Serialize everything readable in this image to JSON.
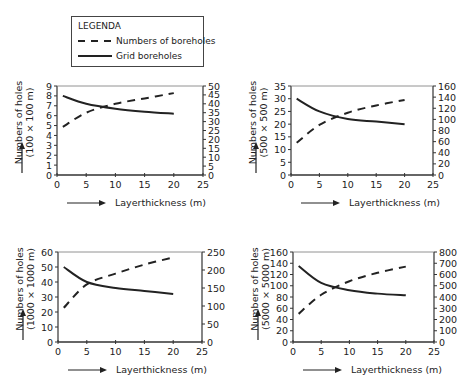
{
  "legend": {
    "title": "LEGENDA",
    "items": [
      {
        "label": "Numbers of boreholes",
        "style": "dashed"
      },
      {
        "label": "Grid boreholes",
        "style": "solid"
      }
    ]
  },
  "colors": {
    "line": "#222222",
    "axis": "#333333",
    "background": "#ffffff"
  },
  "chart_data": [
    {
      "type": "line",
      "title": "",
      "xlabel": "Layerthickness (m)",
      "ylabel": "Numbers of holes (100 × 100 m)",
      "xlim": [
        0,
        25
      ],
      "xticks": [
        0,
        5,
        10,
        15,
        20,
        25
      ],
      "ylim_left": [
        0,
        9
      ],
      "yticks_left": [
        0,
        1,
        2,
        3,
        4,
        5,
        6,
        7,
        8,
        9
      ],
      "ylim_right": [
        0,
        50
      ],
      "yticks_right": [
        0,
        5,
        10,
        15,
        20,
        25,
        30,
        35,
        40,
        45,
        50
      ],
      "grid": false,
      "x": [
        1,
        5,
        10,
        15,
        20
      ],
      "series": [
        {
          "name": "Grid boreholes",
          "axis": "left",
          "style": "solid",
          "values": [
            8.0,
            7.2,
            6.7,
            6.4,
            6.2
          ]
        },
        {
          "name": "Numbers of boreholes",
          "axis": "right",
          "style": "dashed",
          "values": [
            27,
            35,
            40,
            43,
            46
          ]
        }
      ]
    },
    {
      "type": "line",
      "title": "",
      "xlabel": "Layerthickness (m)",
      "ylabel": "Numbers of holes (500 × 500 m)",
      "xlim": [
        0,
        25
      ],
      "xticks": [
        0,
        5,
        10,
        15,
        20,
        25
      ],
      "ylim_left": [
        0,
        35
      ],
      "yticks_left": [
        0,
        5,
        10,
        15,
        20,
        25,
        30,
        35
      ],
      "ylim_right": [
        0,
        160
      ],
      "yticks_right": [
        0,
        20,
        40,
        60,
        80,
        100,
        120,
        140,
        160
      ],
      "grid": false,
      "x": [
        1,
        5,
        10,
        15,
        20
      ],
      "series": [
        {
          "name": "Grid boreholes",
          "axis": "left",
          "style": "solid",
          "values": [
            30,
            25,
            22,
            21,
            20
          ]
        },
        {
          "name": "Numbers of boreholes",
          "axis": "right",
          "style": "dashed",
          "values": [
            58,
            90,
            112,
            125,
            135
          ]
        }
      ]
    },
    {
      "type": "line",
      "title": "",
      "xlabel": "Layerthickness (m)",
      "ylabel": "Numbers of holes (1000 × 1000 m)",
      "xlim": [
        0,
        25
      ],
      "xticks": [
        0,
        5,
        10,
        15,
        20,
        25
      ],
      "ylim_left": [
        0,
        60
      ],
      "yticks_left": [
        0,
        10,
        20,
        30,
        40,
        50,
        60
      ],
      "ylim_right": [
        0,
        250
      ],
      "yticks_right": [
        0,
        50,
        100,
        150,
        200,
        250
      ],
      "grid": false,
      "x": [
        1,
        5,
        10,
        15,
        20
      ],
      "series": [
        {
          "name": "Grid boreholes",
          "axis": "left",
          "style": "solid",
          "values": [
            50,
            40,
            36,
            34,
            32
          ]
        },
        {
          "name": "Numbers of boreholes",
          "axis": "right",
          "style": "dashed",
          "values": [
            95,
            160,
            190,
            215,
            235
          ]
        }
      ]
    },
    {
      "type": "line",
      "title": "",
      "xlabel": "Layerthickness (m)",
      "ylabel": "Numbers of holes (5000 × 5000 m)",
      "xlim": [
        0,
        25
      ],
      "xticks": [
        0,
        5,
        10,
        15,
        20,
        25
      ],
      "ylim_left": [
        0,
        160
      ],
      "yticks_left": [
        0,
        20,
        40,
        60,
        80,
        100,
        120,
        140,
        160
      ],
      "ylim_right": [
        0,
        800
      ],
      "yticks_right": [
        0,
        100,
        200,
        300,
        400,
        500,
        600,
        700,
        800
      ],
      "grid": false,
      "x": [
        1,
        5,
        10,
        15,
        20
      ],
      "series": [
        {
          "name": "Grid boreholes",
          "axis": "left",
          "style": "solid",
          "values": [
            135,
            105,
            92,
            86,
            83
          ]
        },
        {
          "name": "Numbers of boreholes",
          "axis": "right",
          "style": "dashed",
          "values": [
            250,
            420,
            540,
            615,
            670
          ]
        }
      ]
    }
  ]
}
